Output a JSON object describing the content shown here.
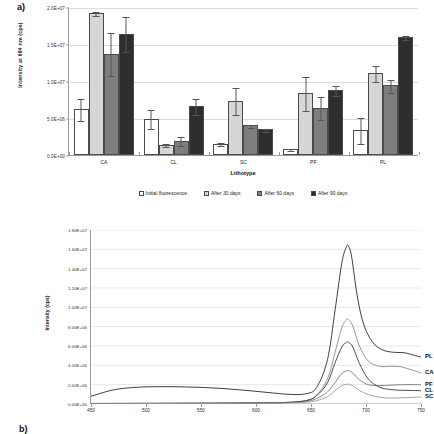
{
  "figure": {
    "panel_a_label": "a)",
    "panel_b_label": "b)"
  },
  "chart_data": [
    {
      "type": "bar",
      "panel": "a)",
      "title": "",
      "xlabel": "Lithotype",
      "ylabel": "Intensity at 684 nm (cps)",
      "categories": [
        "CA",
        "CL",
        "SC",
        "PF",
        "PL"
      ],
      "ylim": [
        0,
        20000000
      ],
      "ytick_labels": [
        "0.0E+00",
        "5.0E+06",
        "1.0E+07",
        "1.5E+07",
        "2.0E+07"
      ],
      "ytick_values": [
        0,
        5000000,
        10000000,
        15000000,
        20000000
      ],
      "grid": true,
      "legend_position": "bottom",
      "series": [
        {
          "name": "Initial fluorescence",
          "color": "#ffffff",
          "values": [
            6200000,
            4900000,
            1500000,
            800000,
            3400000
          ],
          "errors": [
            1450000,
            1300000,
            200000,
            150000,
            1800000
          ]
        },
        {
          "name": "After 30 days",
          "color": "#d6d6d6",
          "values": [
            19200000,
            1400000,
            7350000,
            8350000,
            11100000
          ],
          "errors": [
            300000,
            250000,
            1850000,
            2300000,
            1100000
          ]
        },
        {
          "name": "After 60 days",
          "color": "#7e7e7e",
          "values": [
            13700000,
            1950000,
            4050000,
            6400000,
            9400000
          ],
          "errors": [
            2900000,
            600000,
            200000,
            1600000,
            900000
          ]
        },
        {
          "name": "After 90 days",
          "color": "#2e2e2e",
          "values": [
            16400000,
            6600000,
            3450000,
            8800000,
            15900000
          ],
          "errors": [
            2400000,
            1100000,
            200000,
            700000,
            250000
          ]
        }
      ]
    },
    {
      "type": "line",
      "panel": "b)",
      "title": "",
      "xlabel": "",
      "ylabel": "Intensity (cps)",
      "xlim": [
        450,
        750
      ],
      "ylim": [
        0,
        18000000
      ],
      "xtick_labels": [
        "450",
        "500",
        "550",
        "600",
        "650",
        "700",
        "750"
      ],
      "xtick_values": [
        450,
        500,
        550,
        600,
        650,
        700,
        750
      ],
      "ytick_labels": [
        "0.00E+00",
        "2.00E+06",
        "4.00E+06",
        "6.00E+06",
        "8.00E+06",
        "1.00E+07",
        "1.20E+07",
        "1.40E+07",
        "1.60E+07",
        "1.80E+07"
      ],
      "ytick_values": [
        0,
        2000000,
        4000000,
        6000000,
        8000000,
        10000000,
        12000000,
        14000000,
        16000000,
        18000000
      ],
      "grid": true,
      "legend_position": "right-inline",
      "series": [
        {
          "name": "PL",
          "color": "#2a2a2a",
          "peak_x": 684,
          "peak_y": 16350000,
          "x": [
            450,
            470,
            490,
            510,
            530,
            550,
            570,
            590,
            610,
            630,
            645,
            655,
            665,
            672,
            678,
            682,
            684,
            687,
            692,
            698,
            706,
            715,
            725,
            735,
            745,
            750
          ],
          "y": [
            800000,
            1450000,
            1720000,
            1790000,
            1780000,
            1720000,
            1600000,
            1420000,
            1200000,
            1000000,
            1050000,
            1700000,
            4600000,
            9800000,
            14600000,
            16200000,
            16350000,
            15200000,
            11200000,
            8200000,
            6400000,
            5600000,
            5350000,
            5300000,
            5000000,
            4850000
          ]
        },
        {
          "name": "CA",
          "color": "#8a8a8a",
          "peak_x": 684,
          "peak_y": 8750000,
          "x": [
            450,
            480,
            510,
            540,
            570,
            600,
            625,
            645,
            655,
            665,
            672,
            678,
            682,
            684,
            688,
            694,
            702,
            712,
            722,
            732,
            742,
            750
          ],
          "y": [
            60000,
            70000,
            80000,
            90000,
            100000,
            120000,
            160000,
            350000,
            900000,
            2600000,
            5400000,
            7900000,
            8700000,
            8750000,
            8050000,
            6000000,
            4450000,
            3900000,
            3900000,
            3850000,
            3500000,
            3200000
          ]
        },
        {
          "name": "PF",
          "color": "#777777",
          "peak_x": 684,
          "peak_y": 3450000,
          "x": [
            450,
            480,
            510,
            540,
            570,
            600,
            625,
            645,
            655,
            665,
            672,
            678,
            682,
            684,
            688,
            694,
            702,
            712,
            722,
            732,
            742,
            750
          ],
          "y": [
            50000,
            55000,
            60000,
            70000,
            80000,
            100000,
            130000,
            260000,
            560000,
            1250000,
            2250000,
            3150000,
            3420000,
            3450000,
            3200000,
            2500000,
            2000000,
            1900000,
            1950000,
            2000000,
            2000000,
            2000000
          ]
        },
        {
          "name": "CL",
          "color": "#3a3a3a",
          "peak_x": 684,
          "peak_y": 6400000,
          "x": [
            450,
            480,
            510,
            540,
            570,
            600,
            625,
            645,
            655,
            665,
            672,
            678,
            682,
            684,
            688,
            694,
            702,
            712,
            722,
            732,
            742,
            750
          ],
          "y": [
            55000,
            60000,
            65000,
            75000,
            85000,
            110000,
            150000,
            330000,
            850000,
            2200000,
            4300000,
            5900000,
            6350000,
            6400000,
            5900000,
            4200000,
            2600000,
            1750000,
            1500000,
            1420000,
            1400000,
            1380000
          ]
        },
        {
          "name": "SC",
          "color": "#9a9a9a",
          "peak_x": 684,
          "peak_y": 2050000,
          "x": [
            450,
            480,
            510,
            540,
            570,
            600,
            625,
            645,
            655,
            665,
            672,
            678,
            682,
            684,
            688,
            694,
            702,
            712,
            722,
            732,
            742,
            750
          ],
          "y": [
            40000,
            45000,
            50000,
            55000,
            65000,
            80000,
            100000,
            180000,
            350000,
            760000,
            1400000,
            1900000,
            2030000,
            2050000,
            1880000,
            1400000,
            980000,
            700000,
            620000,
            640000,
            680000,
            720000
          ]
        }
      ]
    }
  ]
}
